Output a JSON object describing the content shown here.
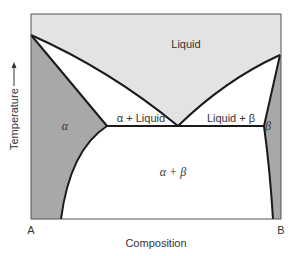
{
  "diagram": {
    "type": "binary eutectic phase diagram",
    "axes": {
      "x_label": "Composition",
      "y_label": "Temperature",
      "y_arrow": "up-arrow",
      "x_left_end": "A",
      "x_right_end": "B"
    },
    "regions": {
      "liquid": "Liquid",
      "alpha_liquid": "α + Liquid",
      "liquid_beta": "Liquid + β",
      "alpha": "α",
      "beta": "β",
      "alpha_beta": "α + β"
    },
    "colors": {
      "liquid_fill": "#e3e3e3",
      "solid_solution_fill": "#a8a8a8",
      "two_phase_fill": "#ffffff",
      "line": "#1a1a1a",
      "frame": "#555555"
    }
  }
}
